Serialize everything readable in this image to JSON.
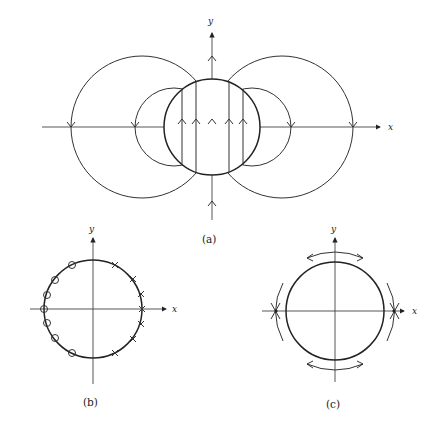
{
  "figure": {
    "panels": [
      {
        "id": "a",
        "caption": "(a)",
        "x_label": "x",
        "y_label": "y",
        "description": "Field lines: two pairs of nested circles on x-axis plus central circle crossed by vertical upward lines"
      },
      {
        "id": "b",
        "caption": "(b)",
        "x_label": "x",
        "y_label": "y",
        "description": "Unit circle with circle markers on left half and cross markers on right half",
        "circle_markers": 7,
        "cross_markers": 7
      },
      {
        "id": "c",
        "caption": "(c)",
        "x_label": "x",
        "y_label": "y",
        "description": "Circle with arcs and double-headed arrows above and below, crosses at x-axis intersections"
      }
    ]
  }
}
